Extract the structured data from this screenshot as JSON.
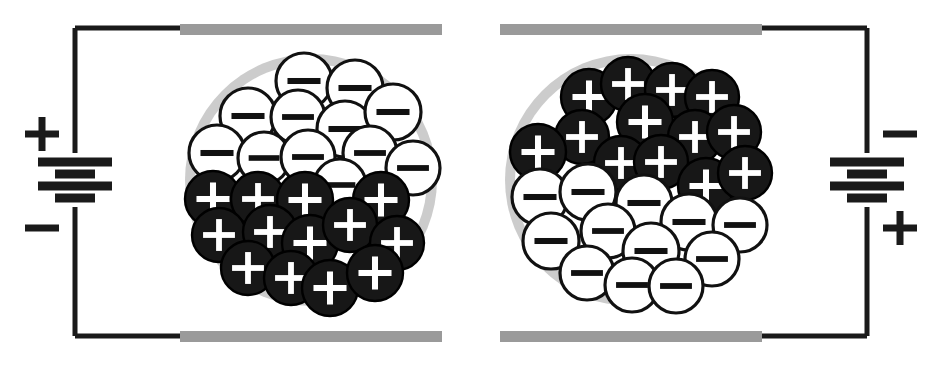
{
  "figure": {
    "title": "Electrophoretic display microcapsule under applied voltage",
    "type": "diagram",
    "width": 942,
    "height": 365,
    "background_color": "#ffffff"
  },
  "colors": {
    "wire": "#1a1a1a",
    "electrode": "#9a9a9a",
    "capsule_shell": "#cccccc",
    "capsule_fill": "#ffffff",
    "particle_negative_fill": "#ffffff",
    "particle_negative_stroke": "#111111",
    "particle_positive_fill": "#171717",
    "particle_positive_stroke": "#000000",
    "sign_on_dark": "#ffffff",
    "sign_on_light": "#111111"
  },
  "geometry": {
    "electrode": {
      "height": 11,
      "top_y": 24,
      "bottom_y": 331
    },
    "wire_width": 5,
    "battery": {
      "long_plate_width": 74,
      "short_plate_width": 40,
      "plate_height": 9,
      "gap": 12
    }
  },
  "panels": [
    {
      "id": "left-panel",
      "name": "left-cell",
      "label": "Left cell: top electrode positive",
      "electrode_top": {
        "name": "top-electrode-left",
        "x": 180,
        "width": 262
      },
      "electrode_bottom": {
        "name": "bottom-electrode-left",
        "x": 180,
        "width": 262
      },
      "capsule": {
        "cx": 311,
        "cy": 180,
        "r_outer": 126,
        "r_inner": 116
      },
      "battery": {
        "name": "battery-left",
        "x": 75,
        "cy": 180,
        "top_terminal_label": "+",
        "bottom_terminal_label": "−",
        "top_label_pos": {
          "x": 42,
          "y": 134
        },
        "bottom_label_pos": {
          "x": 42,
          "y": 228
        }
      },
      "wire_path": "M 75,28 L 75,153 M 75,207 L 75,336 M 75,28 L 182,28 M 75,336 L 182,336",
      "particles_negative_count": 16,
      "particles_positive_count": 17,
      "negative_region": "top",
      "positive_region": "bottom",
      "particles": [
        {
          "type": "negative",
          "cx": 304,
          "cy": 81,
          "r": 28
        },
        {
          "type": "negative",
          "cx": 355,
          "cy": 88,
          "r": 28
        },
        {
          "type": "negative",
          "cx": 248,
          "cy": 116,
          "r": 28
        },
        {
          "type": "negative",
          "cx": 298,
          "cy": 117,
          "r": 27
        },
        {
          "type": "negative",
          "cx": 345,
          "cy": 129,
          "r": 28
        },
        {
          "type": "negative",
          "cx": 393,
          "cy": 112,
          "r": 28
        },
        {
          "type": "negative",
          "cx": 217,
          "cy": 153,
          "r": 28
        },
        {
          "type": "negative",
          "cx": 264,
          "cy": 158,
          "r": 26
        },
        {
          "type": "negative",
          "cx": 308,
          "cy": 157,
          "r": 27
        },
        {
          "type": "negative",
          "cx": 370,
          "cy": 153,
          "r": 27
        },
        {
          "type": "negative",
          "cx": 413,
          "cy": 168,
          "r": 27
        },
        {
          "type": "negative",
          "cx": 340,
          "cy": 185,
          "r": 26
        },
        {
          "type": "positive",
          "cx": 213,
          "cy": 199,
          "r": 28
        },
        {
          "type": "positive",
          "cx": 258,
          "cy": 199,
          "r": 27
        },
        {
          "type": "positive",
          "cx": 305,
          "cy": 200,
          "r": 28
        },
        {
          "type": "positive",
          "cx": 381,
          "cy": 200,
          "r": 28
        },
        {
          "type": "positive",
          "cx": 219,
          "cy": 235,
          "r": 27
        },
        {
          "type": "positive",
          "cx": 270,
          "cy": 232,
          "r": 27
        },
        {
          "type": "positive",
          "cx": 310,
          "cy": 243,
          "r": 28
        },
        {
          "type": "positive",
          "cx": 350,
          "cy": 225,
          "r": 27
        },
        {
          "type": "positive",
          "cx": 397,
          "cy": 243,
          "r": 27
        },
        {
          "type": "positive",
          "cx": 248,
          "cy": 268,
          "r": 27
        },
        {
          "type": "positive",
          "cx": 291,
          "cy": 278,
          "r": 27
        },
        {
          "type": "positive",
          "cx": 330,
          "cy": 288,
          "r": 28
        },
        {
          "type": "positive",
          "cx": 375,
          "cy": 273,
          "r": 28
        }
      ]
    },
    {
      "id": "right-panel",
      "name": "right-cell",
      "label": "Right cell: top electrode negative",
      "electrode_top": {
        "name": "top-electrode-right",
        "x": 500,
        "width": 262
      },
      "electrode_bottom": {
        "name": "bottom-electrode-right",
        "x": 500,
        "width": 262
      },
      "capsule": {
        "cx": 631,
        "cy": 180,
        "r_outer": 126,
        "r_inner": 116
      },
      "battery": {
        "name": "battery-right",
        "x": 867,
        "cy": 180,
        "top_terminal_label": "−",
        "bottom_terminal_label": "+",
        "top_label_pos": {
          "x": 900,
          "y": 134
        },
        "bottom_label_pos": {
          "x": 900,
          "y": 228
        }
      },
      "wire_path": "M 867,28 L 867,153 M 867,207 L 867,336 M 760,28 L 867,28 M 760,336 L 867,336",
      "particles_negative_count": 17,
      "particles_positive_count": 16,
      "negative_region": "bottom",
      "positive_region": "top",
      "particles": [
        {
          "type": "positive",
          "cx": 589,
          "cy": 97,
          "r": 28
        },
        {
          "type": "positive",
          "cx": 628,
          "cy": 84,
          "r": 27
        },
        {
          "type": "positive",
          "cx": 672,
          "cy": 90,
          "r": 27
        },
        {
          "type": "positive",
          "cx": 712,
          "cy": 97,
          "r": 27
        },
        {
          "type": "positive",
          "cx": 645,
          "cy": 122,
          "r": 28
        },
        {
          "type": "positive",
          "cx": 582,
          "cy": 137,
          "r": 27
        },
        {
          "type": "positive",
          "cx": 538,
          "cy": 152,
          "r": 28
        },
        {
          "type": "positive",
          "cx": 695,
          "cy": 137,
          "r": 27
        },
        {
          "type": "positive",
          "cx": 734,
          "cy": 132,
          "r": 27
        },
        {
          "type": "positive",
          "cx": 621,
          "cy": 163,
          "r": 27
        },
        {
          "type": "positive",
          "cx": 661,
          "cy": 162,
          "r": 27
        },
        {
          "type": "positive",
          "cx": 706,
          "cy": 186,
          "r": 28
        },
        {
          "type": "positive",
          "cx": 745,
          "cy": 173,
          "r": 27
        },
        {
          "type": "negative",
          "cx": 540,
          "cy": 197,
          "r": 28
        },
        {
          "type": "negative",
          "cx": 588,
          "cy": 192,
          "r": 28
        },
        {
          "type": "negative",
          "cx": 644,
          "cy": 203,
          "r": 28
        },
        {
          "type": "negative",
          "cx": 689,
          "cy": 222,
          "r": 28
        },
        {
          "type": "negative",
          "cx": 740,
          "cy": 225,
          "r": 27
        },
        {
          "type": "negative",
          "cx": 608,
          "cy": 231,
          "r": 27
        },
        {
          "type": "negative",
          "cx": 551,
          "cy": 241,
          "r": 28
        },
        {
          "type": "negative",
          "cx": 651,
          "cy": 251,
          "r": 28
        },
        {
          "type": "negative",
          "cx": 712,
          "cy": 259,
          "r": 27
        },
        {
          "type": "negative",
          "cx": 587,
          "cy": 273,
          "r": 27
        },
        {
          "type": "negative",
          "cx": 632,
          "cy": 285,
          "r": 27
        },
        {
          "type": "negative",
          "cx": 676,
          "cy": 286,
          "r": 27
        }
      ]
    }
  ],
  "legend": {
    "negative_particle_sign": "−",
    "positive_particle_sign": "+",
    "negative_particle_name": "negatively-charged-white-pigment",
    "positive_particle_name": "positively-charged-black-pigment"
  }
}
